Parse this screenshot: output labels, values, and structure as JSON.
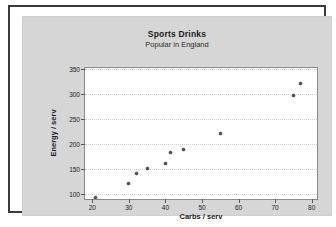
{
  "chart_data": {
    "type": "scatter",
    "title": "Sports Drinks",
    "subtitle": "Popular in England",
    "xlabel": "Carbs / serv",
    "ylabel": "Energy / serv",
    "xlim": [
      18,
      82
    ],
    "ylim": [
      85,
      352
    ],
    "xticks": [
      20,
      30,
      40,
      50,
      60,
      70,
      80
    ],
    "yticks": [
      100,
      150,
      200,
      250,
      300,
      350
    ],
    "grid": "horizontal-dotted",
    "legend": "none",
    "marker": "filled-circle",
    "marker_color": "#4a4a52",
    "points": [
      {
        "x": 21,
        "y": 92
      },
      {
        "x": 30,
        "y": 120
      },
      {
        "x": 32,
        "y": 140
      },
      {
        "x": 35,
        "y": 150
      },
      {
        "x": 40,
        "y": 160
      },
      {
        "x": 41.5,
        "y": 182
      },
      {
        "x": 45,
        "y": 188
      },
      {
        "x": 55,
        "y": 221
      },
      {
        "x": 75,
        "y": 297
      },
      {
        "x": 77,
        "y": 320
      }
    ]
  },
  "figure": {
    "background_color": "#d6d6d6",
    "plot_background_color": "#ffffff",
    "frame_color": "#3a3a3a"
  }
}
